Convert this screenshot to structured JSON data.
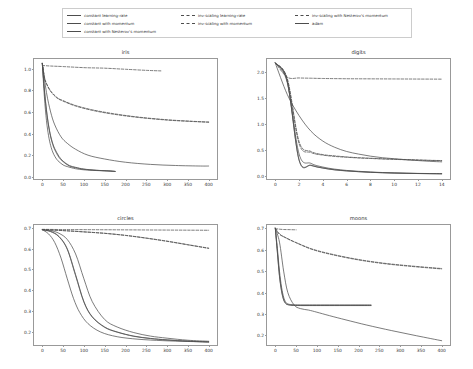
{
  "figure": {
    "width": 473,
    "height": 369,
    "background": "#ffffff",
    "line_color": "#4d4d4d",
    "axis_color": "#999999",
    "text_color": "#333333"
  },
  "legend": {
    "position": "upper-center",
    "frame": true,
    "columns": 3,
    "entries": [
      {
        "label": "constant learning-rate",
        "style": "solid",
        "column": 1
      },
      {
        "label": "constant with momentum",
        "style": "solid",
        "column": 1
      },
      {
        "label": "constant with Nesterov's momentum",
        "style": "solid",
        "column": 1
      },
      {
        "label": "inv-scaling learning-rate",
        "style": "dashed",
        "column": 2
      },
      {
        "label": "inv-scaling with momentum",
        "style": "dashed",
        "column": 2
      },
      {
        "label": "inv-scaling with Nesterov's momentum",
        "style": "dashed",
        "column": 3
      },
      {
        "label": "adam",
        "style": "solid",
        "column": 3
      }
    ]
  },
  "chart_data": [
    {
      "type": "line",
      "title": "iris",
      "xlabel": "",
      "ylabel": "",
      "xlim": [
        -20,
        420
      ],
      "ylim": [
        -0.02,
        1.09
      ],
      "xticks": [
        0,
        50,
        100,
        150,
        200,
        250,
        300,
        350,
        400
      ],
      "yticks": [
        0.0,
        0.2,
        0.4,
        0.6,
        0.8,
        1.0
      ],
      "grid": false,
      "series": [
        {
          "name": "constant learning-rate",
          "style": "solid",
          "x": [
            0,
            5,
            10,
            15,
            20,
            25,
            30,
            35,
            40,
            50,
            60,
            80,
            100,
            120,
            150,
            175
          ],
          "y": [
            1.05,
            0.74,
            0.52,
            0.38,
            0.29,
            0.23,
            0.19,
            0.16,
            0.14,
            0.11,
            0.095,
            0.075,
            0.065,
            0.06,
            0.055,
            0.05
          ]
        },
        {
          "name": "constant with momentum",
          "style": "solid",
          "x": [
            0,
            5,
            10,
            15,
            20,
            25,
            30,
            40,
            50,
            65,
            80,
            100,
            130,
            160,
            175
          ],
          "y": [
            1.05,
            0.8,
            0.61,
            0.47,
            0.37,
            0.3,
            0.25,
            0.18,
            0.14,
            0.1,
            0.085,
            0.07,
            0.06,
            0.055,
            0.05
          ]
        },
        {
          "name": "constant with Nesterov's momentum",
          "style": "solid",
          "x": [
            0,
            5,
            10,
            15,
            20,
            25,
            30,
            40,
            50,
            65,
            80,
            100,
            130,
            160,
            175
          ],
          "y": [
            1.05,
            0.81,
            0.62,
            0.48,
            0.38,
            0.31,
            0.26,
            0.19,
            0.145,
            0.105,
            0.088,
            0.072,
            0.061,
            0.055,
            0.05
          ]
        },
        {
          "name": "inv-scaling learning-rate",
          "style": "dashed",
          "x": [
            0,
            20,
            50,
            100,
            150,
            200,
            250,
            285
          ],
          "y": [
            1.03,
            1.025,
            1.02,
            1.01,
            1.005,
            0.995,
            0.985,
            0.98
          ]
        },
        {
          "name": "inv-scaling with momentum",
          "style": "dashed",
          "x": [
            0,
            5,
            10,
            20,
            35,
            50,
            80,
            120,
            170,
            230,
            300,
            360,
            400
          ],
          "y": [
            1.05,
            0.92,
            0.86,
            0.79,
            0.73,
            0.7,
            0.655,
            0.615,
            0.58,
            0.55,
            0.525,
            0.512,
            0.505
          ]
        },
        {
          "name": "inv-scaling with Nesterov's momentum",
          "style": "dashed",
          "x": [
            0,
            5,
            10,
            20,
            35,
            50,
            80,
            120,
            170,
            230,
            300,
            360,
            400
          ],
          "y": [
            1.05,
            0.925,
            0.865,
            0.795,
            0.735,
            0.705,
            0.66,
            0.62,
            0.585,
            0.553,
            0.528,
            0.514,
            0.507
          ]
        },
        {
          "name": "adam",
          "style": "solid",
          "x": [
            0,
            10,
            20,
            30,
            45,
            60,
            80,
            110,
            150,
            200,
            260,
            320,
            380,
            400
          ],
          "y": [
            1.05,
            0.78,
            0.6,
            0.48,
            0.37,
            0.31,
            0.255,
            0.2,
            0.165,
            0.135,
            0.115,
            0.105,
            0.1,
            0.1
          ]
        }
      ]
    },
    {
      "type": "line",
      "title": "digits",
      "xlabel": "",
      "ylabel": "",
      "xlim": [
        -0.7,
        14.7
      ],
      "ylim": [
        -0.06,
        2.25
      ],
      "xticks": [
        0,
        2,
        4,
        6,
        8,
        10,
        12,
        14
      ],
      "yticks": [
        0.0,
        0.5,
        1.0,
        1.5,
        2.0
      ],
      "grid": false,
      "series": [
        {
          "name": "constant learning-rate",
          "style": "solid",
          "x": [
            0,
            1,
            2,
            3,
            4,
            5,
            6,
            7,
            8,
            9,
            10,
            11,
            12,
            13,
            14
          ],
          "y": [
            2.17,
            1.8,
            0.42,
            0.24,
            0.17,
            0.13,
            0.105,
            0.088,
            0.075,
            0.065,
            0.058,
            0.052,
            0.048,
            0.045,
            0.043
          ]
        },
        {
          "name": "constant with momentum",
          "style": "solid",
          "x": [
            0,
            1,
            2,
            3,
            4,
            5,
            6,
            7,
            8,
            9,
            10,
            11,
            12,
            13,
            14
          ],
          "y": [
            2.17,
            1.82,
            0.3,
            0.2,
            0.15,
            0.115,
            0.095,
            0.08,
            0.068,
            0.06,
            0.054,
            0.049,
            0.045,
            0.042,
            0.04
          ]
        },
        {
          "name": "constant with Nesterov's momentum",
          "style": "solid",
          "x": [
            0,
            1,
            2,
            3,
            4,
            5,
            6,
            7,
            8,
            9,
            10,
            11,
            12,
            13,
            14
          ],
          "y": [
            2.17,
            1.83,
            0.31,
            0.205,
            0.152,
            0.118,
            0.097,
            0.082,
            0.07,
            0.061,
            0.055,
            0.05,
            0.046,
            0.043,
            0.041
          ]
        },
        {
          "name": "inv-scaling learning-rate",
          "style": "dashed",
          "x": [
            0,
            1,
            2,
            3,
            4,
            6,
            8,
            10,
            12,
            14
          ],
          "y": [
            2.18,
            1.9,
            1.885,
            1.88,
            1.875,
            1.87,
            1.868,
            1.866,
            1.864,
            1.862
          ]
        },
        {
          "name": "inv-scaling with momentum",
          "style": "dashed",
          "x": [
            0,
            1,
            2,
            3,
            4,
            5,
            6,
            7,
            8,
            9,
            10,
            11,
            12,
            13,
            14
          ],
          "y": [
            2.17,
            1.88,
            0.66,
            0.47,
            0.41,
            0.385,
            0.365,
            0.35,
            0.34,
            0.33,
            0.322,
            0.315,
            0.308,
            0.3,
            0.295
          ]
        },
        {
          "name": "inv-scaling with Nesterov's momentum",
          "style": "dashed",
          "x": [
            0,
            1,
            2,
            3,
            4,
            5,
            6,
            7,
            8,
            9,
            10,
            11,
            12,
            13,
            14
          ],
          "y": [
            2.17,
            1.86,
            0.62,
            0.45,
            0.4,
            0.375,
            0.358,
            0.345,
            0.335,
            0.325,
            0.318,
            0.31,
            0.303,
            0.297,
            0.292
          ]
        },
        {
          "name": "adam",
          "style": "solid",
          "x": [
            0,
            1,
            2,
            3,
            4,
            5,
            6,
            7,
            8,
            9,
            10,
            11,
            12,
            13,
            14
          ],
          "y": [
            2.17,
            1.57,
            1.16,
            0.86,
            0.67,
            0.55,
            0.47,
            0.42,
            0.38,
            0.35,
            0.33,
            0.31,
            0.295,
            0.28,
            0.27
          ]
        }
      ]
    },
    {
      "type": "line",
      "title": "circles",
      "xlabel": "",
      "ylabel": "",
      "xlim": [
        -20,
        420
      ],
      "ylim": [
        0.135,
        0.715
      ],
      "xticks": [
        0,
        50,
        100,
        150,
        200,
        250,
        300,
        350,
        400
      ],
      "yticks": [
        0.2,
        0.3,
        0.4,
        0.5,
        0.6,
        0.7
      ],
      "grid": false,
      "series": [
        {
          "name": "constant learning-rate",
          "style": "solid",
          "x": [
            0,
            20,
            40,
            60,
            80,
            100,
            120,
            150,
            180,
            220,
            260,
            300,
            350,
            400
          ],
          "y": [
            0.693,
            0.688,
            0.675,
            0.645,
            0.575,
            0.455,
            0.345,
            0.258,
            0.222,
            0.195,
            0.178,
            0.168,
            0.158,
            0.153
          ]
        },
        {
          "name": "constant with momentum",
          "style": "solid",
          "x": [
            0,
            20,
            40,
            60,
            80,
            100,
            120,
            150,
            180,
            220,
            260,
            300,
            350,
            400
          ],
          "y": [
            0.692,
            0.684,
            0.66,
            0.6,
            0.475,
            0.345,
            0.272,
            0.222,
            0.198,
            0.178,
            0.167,
            0.16,
            0.154,
            0.15
          ]
        },
        {
          "name": "constant with Nesterov's momentum",
          "style": "solid",
          "x": [
            0,
            20,
            40,
            60,
            80,
            100,
            120,
            150,
            180,
            220,
            260,
            300,
            350,
            400
          ],
          "y": [
            0.692,
            0.683,
            0.658,
            0.597,
            0.47,
            0.342,
            0.27,
            0.22,
            0.197,
            0.177,
            0.166,
            0.159,
            0.153,
            0.149
          ]
        },
        {
          "name": "inv-scaling learning-rate",
          "style": "dashed",
          "x": [
            0,
            50,
            100,
            150,
            200,
            250,
            300,
            350,
            400
          ],
          "y": [
            0.694,
            0.693,
            0.6925,
            0.692,
            0.6915,
            0.691,
            0.6905,
            0.69,
            0.6895
          ]
        },
        {
          "name": "inv-scaling with momentum",
          "style": "dashed",
          "x": [
            0,
            50,
            100,
            150,
            200,
            250,
            300,
            350,
            400
          ],
          "y": [
            0.693,
            0.688,
            0.682,
            0.675,
            0.665,
            0.652,
            0.637,
            0.62,
            0.603
          ]
        },
        {
          "name": "inv-scaling with Nesterov's momentum",
          "style": "dashed",
          "x": [
            0,
            50,
            100,
            150,
            200,
            250,
            300,
            350,
            400
          ],
          "y": [
            0.693,
            0.6878,
            0.6815,
            0.6745,
            0.6645,
            0.651,
            0.636,
            0.619,
            0.602
          ]
        },
        {
          "name": "adam",
          "style": "solid",
          "x": [
            0,
            15,
            30,
            45,
            60,
            75,
            90,
            110,
            140,
            180,
            230,
            290,
            350,
            400
          ],
          "y": [
            0.692,
            0.672,
            0.63,
            0.555,
            0.455,
            0.36,
            0.292,
            0.238,
            0.198,
            0.175,
            0.163,
            0.156,
            0.152,
            0.15
          ]
        }
      ]
    },
    {
      "type": "line",
      "title": "moons",
      "xlabel": "",
      "ylabel": "",
      "xlim": [
        -20,
        420
      ],
      "ylim": [
        0.155,
        0.715
      ],
      "xticks": [
        0,
        50,
        100,
        150,
        200,
        250,
        300,
        350,
        400
      ],
      "yticks": [
        0.2,
        0.3,
        0.4,
        0.5,
        0.6,
        0.7
      ],
      "grid": false,
      "series": [
        {
          "name": "constant learning-rate",
          "style": "solid",
          "x": [
            0,
            5,
            10,
            15,
            20,
            25,
            30,
            40,
            60,
            90,
            130,
            180,
            230
          ],
          "y": [
            0.7,
            0.605,
            0.5,
            0.425,
            0.378,
            0.355,
            0.347,
            0.343,
            0.342,
            0.342,
            0.342,
            0.342,
            0.342
          ]
        },
        {
          "name": "constant with momentum",
          "style": "solid",
          "x": [
            0,
            5,
            10,
            15,
            20,
            25,
            30,
            40,
            60,
            90,
            130,
            180,
            230
          ],
          "y": [
            0.7,
            0.585,
            0.475,
            0.405,
            0.365,
            0.348,
            0.343,
            0.34,
            0.339,
            0.339,
            0.339,
            0.339,
            0.339
          ]
        },
        {
          "name": "constant with Nesterov's momentum",
          "style": "solid",
          "x": [
            0,
            5,
            10,
            15,
            20,
            25,
            30,
            40,
            60,
            90,
            130,
            180,
            230
          ],
          "y": [
            0.7,
            0.59,
            0.48,
            0.41,
            0.368,
            0.35,
            0.344,
            0.341,
            0.34,
            0.34,
            0.34,
            0.34,
            0.34
          ]
        },
        {
          "name": "inv-scaling learning-rate",
          "style": "dashed",
          "x": [
            0,
            10,
            20,
            30,
            40,
            50
          ],
          "y": [
            0.698,
            0.6955,
            0.694,
            0.6935,
            0.693,
            0.6925
          ]
        },
        {
          "name": "inv-scaling with momentum",
          "style": "dashed",
          "x": [
            0,
            10,
            25,
            50,
            90,
            140,
            200,
            260,
            320,
            380,
            400
          ],
          "y": [
            0.7,
            0.672,
            0.655,
            0.632,
            0.6,
            0.575,
            0.552,
            0.535,
            0.523,
            0.513,
            0.51
          ]
        },
        {
          "name": "inv-scaling with Nesterov's momentum",
          "style": "dashed",
          "x": [
            0,
            10,
            25,
            50,
            90,
            140,
            200,
            260,
            320,
            380,
            400
          ],
          "y": [
            0.7,
            0.673,
            0.656,
            0.633,
            0.602,
            0.577,
            0.554,
            0.537,
            0.525,
            0.515,
            0.512
          ]
        },
        {
          "name": "adam",
          "style": "solid",
          "x": [
            0,
            10,
            20,
            30,
            45,
            60,
            80,
            100,
            130,
            170,
            220,
            280,
            340,
            400
          ],
          "y": [
            0.7,
            0.635,
            0.5,
            0.4,
            0.342,
            0.325,
            0.318,
            0.308,
            0.292,
            0.272,
            0.248,
            0.222,
            0.198,
            0.175
          ]
        }
      ]
    }
  ]
}
